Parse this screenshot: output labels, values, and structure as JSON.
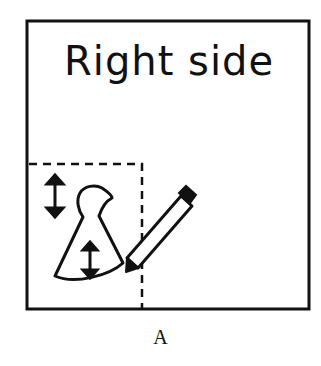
{
  "figure": {
    "title": "Right side",
    "caption": "A",
    "colors": {
      "ink": "#111111",
      "background": "#ffffff"
    },
    "elements": [
      {
        "type": "frame",
        "name": "outer-box"
      },
      {
        "type": "dashed-region",
        "name": "keyhole-area"
      },
      {
        "type": "icon",
        "name": "vertical-arrow"
      },
      {
        "type": "icon",
        "name": "keyhole-shape"
      },
      {
        "type": "icon",
        "name": "pencil"
      }
    ]
  }
}
